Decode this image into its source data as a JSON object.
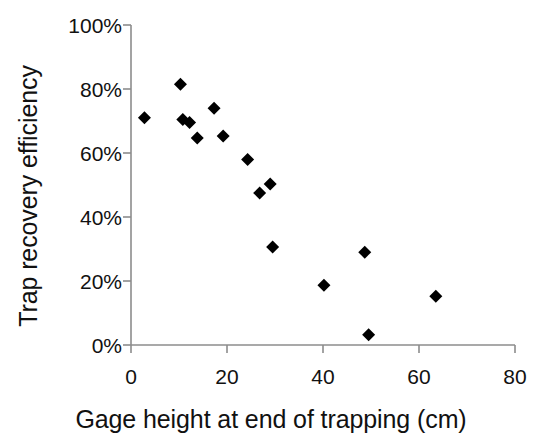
{
  "chart_data": {
    "type": "scatter",
    "title": "",
    "xlabel": "Gage height at end of trapping (cm)",
    "ylabel": "Trap recovery efficiency",
    "xlim": [
      0,
      80
    ],
    "ylim": [
      0,
      100
    ],
    "xticks": [
      0,
      20,
      40,
      60,
      80
    ],
    "yticks": [
      0,
      20,
      40,
      60,
      80,
      100
    ],
    "xtick_labels": [
      "0",
      "20",
      "40",
      "60",
      "80"
    ],
    "ytick_labels": [
      "0%",
      "20%",
      "40%",
      "60%",
      "80%",
      "100%"
    ],
    "grid": false,
    "legend": null,
    "marker": "diamond",
    "marker_color": "#000000",
    "marker_size": 13,
    "series": [
      {
        "name": "Trap recovery efficiency",
        "points": [
          {
            "x": 2.8,
            "y": 71.0
          },
          {
            "x": 10.3,
            "y": 81.5
          },
          {
            "x": 10.8,
            "y": 70.5
          },
          {
            "x": 12.2,
            "y": 69.5
          },
          {
            "x": 13.8,
            "y": 64.7
          },
          {
            "x": 17.3,
            "y": 74.0
          },
          {
            "x": 19.2,
            "y": 65.3
          },
          {
            "x": 24.3,
            "y": 58.0
          },
          {
            "x": 26.8,
            "y": 47.5
          },
          {
            "x": 29.0,
            "y": 50.3
          },
          {
            "x": 29.5,
            "y": 30.6
          },
          {
            "x": 40.2,
            "y": 18.7
          },
          {
            "x": 48.7,
            "y": 29.0
          },
          {
            "x": 49.5,
            "y": 3.2
          },
          {
            "x": 63.5,
            "y": 15.2
          }
        ]
      }
    ],
    "axis_color": "#8c8c8c",
    "background_color": "#ffffff"
  }
}
